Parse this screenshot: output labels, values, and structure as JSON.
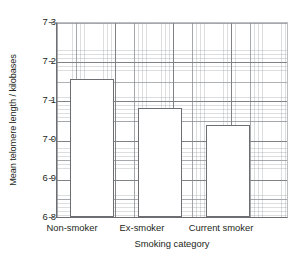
{
  "chart_data": {
    "type": "bar",
    "title": "",
    "xlabel": "Smoking category",
    "ylabel": "Mean telomere length / kilobases",
    "categories": [
      "Non-smoker",
      "Ex-smoker",
      "Current smoker"
    ],
    "values": [
      7.155,
      7.08,
      7.037
    ],
    "ylim": [
      6.8,
      7.3
    ],
    "ytick_labels": [
      "7·3",
      "7·2",
      "7·1",
      "7·0",
      "6·9",
      "6·8"
    ],
    "ytick_values": [
      7.3,
      7.2,
      7.1,
      7.0,
      6.9,
      6.8
    ],
    "grid": "on",
    "grid_minor": "on",
    "legend": "none",
    "bar_fill": "#ffffff",
    "bar_edge": "#6d6e71",
    "grid_major_color": "#808285",
    "grid_minor_color": "#c7c9cb",
    "axis_color": "#6d6e71",
    "text_color": "#231f20",
    "background": "#ffffff"
  }
}
